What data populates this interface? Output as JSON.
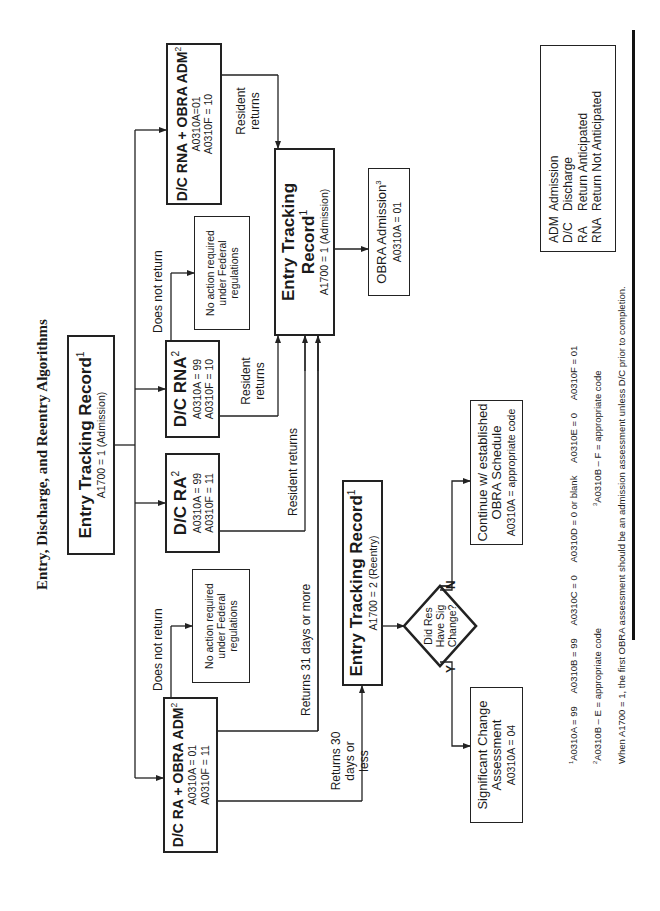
{
  "title": "Entry, Discharge, and Reentry Algorithms",
  "nodes": {
    "entry_admission_top": {
      "title": "Entry Tracking Record",
      "sup": "1",
      "sub": "A1700 = 1 (Admission)"
    },
    "dc_ra_obra": {
      "title": "D/C RA + OBRA ADM",
      "sup": "2",
      "line1": "A0310A = 01",
      "line2": "A0310F = 11"
    },
    "dc_ra": {
      "title": "D/C RA",
      "sup": "2",
      "line1": "A0310A = 99",
      "line2": "A0310F = 11"
    },
    "dc_rna": {
      "title": "D/C RNA",
      "sup": "2",
      "line1": "A0310A = 99",
      "line2": "A0310F = 10"
    },
    "dc_rna_obra": {
      "title": "D/C RNA + OBRA ADM",
      "sup": "2",
      "line1": "A0310A=01",
      "line2": "A0310F = 10"
    },
    "no_action_left": {
      "text": "No action required under Federal regulations"
    },
    "no_action_right": {
      "text": "No action required under Federal regulations"
    },
    "entry_reentry": {
      "title": "Entry Tracking Record",
      "sup": "1",
      "sub": "A1700 = 2 (Reentry)"
    },
    "entry_admission_mid": {
      "title": "Entry Tracking Record",
      "sup": "1",
      "sub": "A1700 = 1 (Admission)"
    },
    "obra_admission": {
      "title": "OBRA Admission",
      "sup": "3",
      "sub": "A0310A = 01"
    },
    "decision": {
      "text": "Did Res Have Sig Change?",
      "yes": "Y",
      "no": "N"
    },
    "sig_change": {
      "title": "Significant Change Assessment",
      "sup": "3",
      "sub": "A0310A = 04"
    },
    "continue_obra": {
      "title": "Continue w/ established OBRA Schedule",
      "sup": "3",
      "sub": "A0310A = appropriate code"
    }
  },
  "edge_labels": {
    "does_not_return_left": "Does not return",
    "does_not_return_right": "Does not return",
    "returns_30": "Returns 30 days or less",
    "returns_31": "Returns 31 days or more",
    "resident_returns_ra": "Resident returns",
    "resident_returns_rna": "Resident returns",
    "resident_returns_rna_obra": "Resident returns"
  },
  "legend": [
    {
      "abbr": "ADM",
      "meaning": "Admission"
    },
    {
      "abbr": "D/C",
      "meaning": "Discharge"
    },
    {
      "abbr": "RA",
      "meaning": "Return Anticipated"
    },
    {
      "abbr": "RNA",
      "meaning": "Return Not Anticipated"
    }
  ],
  "footnotes": {
    "note1": "A0310A = 99     A0310B = 99     A0310C = 0     A0310D = 0 or blank     A0310E = 0     A0310F = 01",
    "note2": "A0310B – E = appropriate code",
    "note3": "A0310B – F = appropriate code",
    "note_when": "When A1700 = 1, the first OBRA assessment should be an admission assessment unless D/C prior to completion."
  }
}
